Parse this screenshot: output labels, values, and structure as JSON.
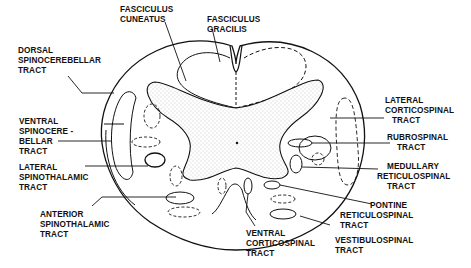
{
  "figure": {
    "colors": {
      "ink": "#111111",
      "background": "#ffffff",
      "stipple": "#888888"
    }
  },
  "labels": {
    "fasciculus_cuneatus": [
      "FASCICULUS",
      "CUNEATUS"
    ],
    "fasciculus_gracilis": [
      "FASCICULUS",
      "GRACILIS"
    ],
    "dorsal_spinocerebellar": [
      "DORSAL",
      "SPINOCEREBELLAR",
      "TRACT"
    ],
    "ventral_spinocerebellar": [
      "VENTRAL",
      "SPINOCERE -",
      "BELLAR",
      "TRACT"
    ],
    "lateral_spinothalamic": [
      "LATERAL",
      "SPINOTHALAMIC",
      "TRACT"
    ],
    "anterior_spinothalamic": [
      "ANTERIOR",
      "SPINOTHALAMIC",
      "TRACT"
    ],
    "ventral_corticospinal": [
      "VENTRAL",
      "CORTICOSPINAL",
      "TRACT"
    ],
    "vestibulospinal": [
      "VESTIBULOSPINAL",
      "TRACT"
    ],
    "pontine_reticulospinal": [
      "PONTINE",
      "RETICULOSPINAL",
      "TRACT"
    ],
    "medullary_reticulospinal": [
      "MEDULLARY",
      "RETICULOSPINAL",
      "TRACT"
    ],
    "rubrospinal": [
      "RUBROSPINAL",
      "TRACT"
    ],
    "lateral_corticospinal": [
      "LATERAL",
      "CORTICOSPINAL",
      "TRACT"
    ]
  }
}
